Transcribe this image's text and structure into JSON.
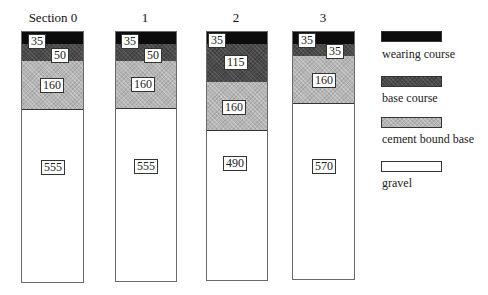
{
  "diagram": {
    "type": "stacked-layer-sections",
    "units_note": "",
    "sections": [
      {
        "title": "Section 0",
        "layers": {
          "wearing_course": "35",
          "base_course": "50",
          "cement_bound_base": "160",
          "gravel": "555"
        }
      },
      {
        "title": "1",
        "layers": {
          "wearing_course": "35",
          "base_course": "50",
          "cement_bound_base": "160",
          "gravel": "555"
        }
      },
      {
        "title": "2",
        "layers": {
          "wearing_course": "35",
          "base_course": "115",
          "cement_bound_base": "160",
          "gravel": "490"
        }
      },
      {
        "title": "3",
        "layers": {
          "wearing_course": "35",
          "base_course": "35",
          "cement_bound_base": "160",
          "gravel": "570"
        }
      }
    ],
    "legend": [
      {
        "key": "wearing_course",
        "label": "wearing course",
        "color": "#0c0c0c"
      },
      {
        "key": "base_course",
        "label": "base course",
        "color": "#4a4a4a"
      },
      {
        "key": "cement_bound_base",
        "label": "cement bound base",
        "color": "#b5b5b5"
      },
      {
        "key": "gravel",
        "label": "gravel",
        "color": "#ffffff"
      }
    ]
  }
}
